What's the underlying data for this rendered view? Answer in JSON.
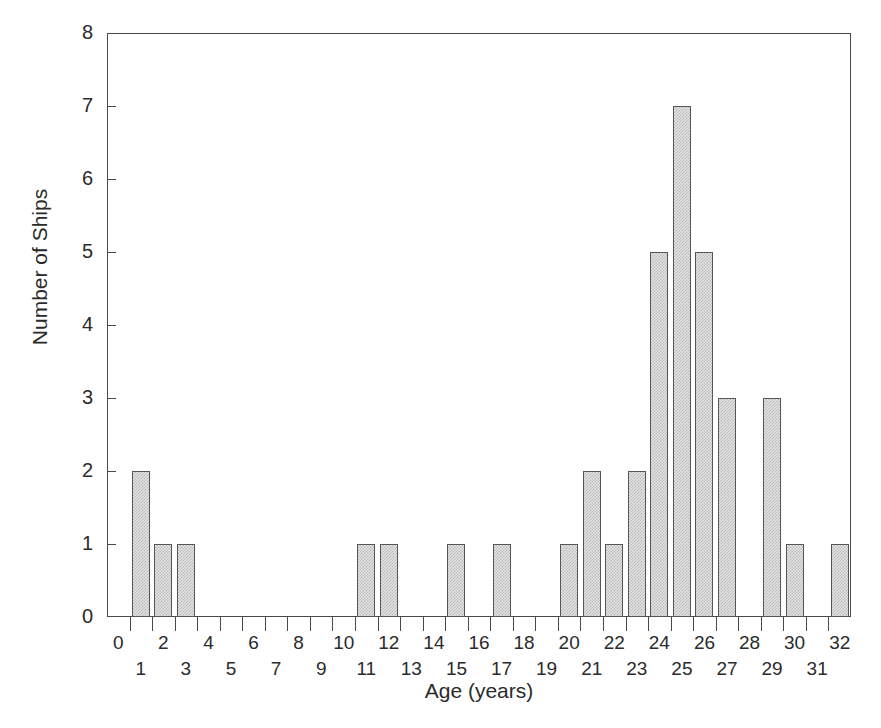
{
  "chart_data": {
    "type": "bar",
    "title": "",
    "subtitle": "",
    "xlabel": "Age (years)",
    "ylabel": "Number of Ships",
    "categories": [
      0,
      1,
      2,
      3,
      4,
      5,
      6,
      7,
      8,
      9,
      10,
      11,
      12,
      13,
      14,
      15,
      16,
      17,
      18,
      19,
      20,
      21,
      22,
      23,
      24,
      25,
      26,
      27,
      28,
      29,
      30,
      31,
      32
    ],
    "values": [
      0,
      2,
      1,
      1,
      0,
      0,
      0,
      0,
      0,
      0,
      0,
      1,
      1,
      0,
      0,
      1,
      0,
      1,
      0,
      0,
      1,
      2,
      1,
      2,
      5,
      7,
      5,
      3,
      0,
      3,
      1,
      0,
      1
    ],
    "xlim": [
      -0.5,
      32.5
    ],
    "ylim": [
      0,
      8
    ],
    "y_ticks": [
      0,
      1,
      2,
      3,
      4,
      5,
      6,
      7,
      8
    ],
    "x_ticks_even": [
      0,
      2,
      4,
      6,
      8,
      10,
      12,
      14,
      16,
      18,
      20,
      22,
      24,
      26,
      28,
      30,
      32
    ],
    "x_ticks_odd": [
      1,
      3,
      5,
      7,
      9,
      11,
      13,
      15,
      17,
      19,
      21,
      23,
      25,
      27,
      29,
      31
    ],
    "grid": false,
    "legend": null,
    "bar_fill_color": "#e4e4e4",
    "bar_pattern_color": "#b9b9b9",
    "bar_edge_color": "#565656",
    "axis_color": "#4a4a4a",
    "text_color": "#2b2b2b"
  },
  "axes": {
    "y_title": "Number of Ships",
    "x_title": "Age (years)",
    "y_tick_labels": [
      "0",
      "1",
      "2",
      "3",
      "4",
      "5",
      "6",
      "7",
      "8"
    ],
    "x_tick_labels": [
      "0",
      "1",
      "2",
      "3",
      "4",
      "5",
      "6",
      "7",
      "8",
      "9",
      "10",
      "11",
      "12",
      "13",
      "14",
      "15",
      "16",
      "17",
      "18",
      "19",
      "20",
      "21",
      "22",
      "23",
      "24",
      "25",
      "26",
      "27",
      "28",
      "29",
      "30",
      "31",
      "32"
    ]
  }
}
